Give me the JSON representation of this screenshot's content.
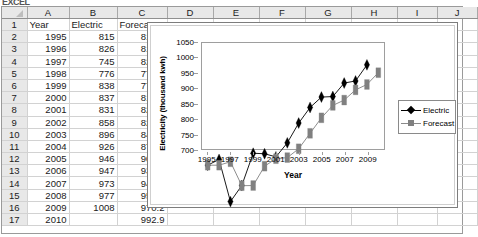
{
  "window": {
    "clipped_title": "EXCEL"
  },
  "sheet": {
    "column_headers": [
      "A",
      "B",
      "C",
      "D",
      "E",
      "F",
      "G",
      "H",
      "I",
      "J"
    ],
    "row_headers": [
      "1",
      "2",
      "3",
      "4",
      "5",
      "6",
      "7",
      "8",
      "9",
      "10",
      "11",
      "12",
      "13",
      "14",
      "15",
      "16",
      "17"
    ],
    "header_row": {
      "a": "Year",
      "b": "Electric",
      "c": "Forecast"
    },
    "rows": [
      {
        "row": "2",
        "year": "1995",
        "electric": "815",
        "forecast": "815.0"
      },
      {
        "row": "3",
        "year": "1996",
        "electric": "826",
        "forecast": "815.0"
      },
      {
        "row": "4",
        "year": "1997",
        "electric": "745",
        "forecast": "821.6"
      },
      {
        "row": "5",
        "year": "1998",
        "electric": "776",
        "forecast": "775.6"
      },
      {
        "row": "6",
        "year": "1999",
        "electric": "838",
        "forecast": "775.9"
      },
      {
        "row": "7",
        "year": "2000",
        "electric": "837",
        "forecast": "813.1"
      },
      {
        "row": "8",
        "year": "2001",
        "electric": "831",
        "forecast": "827.5"
      },
      {
        "row": "9",
        "year": "2002",
        "electric": "858",
        "forecast": "829.6"
      },
      {
        "row": "10",
        "year": "2003",
        "electric": "896",
        "forecast": "846.6"
      },
      {
        "row": "11",
        "year": "2004",
        "electric": "926",
        "forecast": "876.3"
      },
      {
        "row": "12",
        "year": "2005",
        "electric": "946",
        "forecast": "906.1"
      },
      {
        "row": "13",
        "year": "2006",
        "electric": "947",
        "forecast": "930.0"
      },
      {
        "row": "14",
        "year": "2007",
        "electric": "973",
        "forecast": "940.2"
      },
      {
        "row": "15",
        "year": "2008",
        "electric": "977",
        "forecast": "959.9"
      },
      {
        "row": "16",
        "year": "2009",
        "electric": "1008",
        "forecast": "970.2"
      },
      {
        "row": "17",
        "year": "2010",
        "electric": "",
        "forecast": "992.9"
      }
    ]
  },
  "chart_data": {
    "type": "line",
    "title": "",
    "xlabel": "Year",
    "ylabel": "Electricity (thousand kwh)",
    "x": [
      1995,
      1996,
      1997,
      1998,
      1999,
      2000,
      2001,
      2002,
      2003,
      2004,
      2005,
      2006,
      2007,
      2008,
      2009,
      2010
    ],
    "xticks": [
      "1995",
      "1997",
      "1999",
      "2001",
      "2003",
      "2005",
      "2007",
      "2009"
    ],
    "xlim": [
      1994.5,
      2010.5
    ],
    "yticks": [
      "700",
      "750",
      "800",
      "850",
      "900",
      "950",
      "1000",
      "1050"
    ],
    "ylim": [
      700,
      1050
    ],
    "grid": false,
    "legend_position": "right",
    "series": [
      {
        "name": "Electric",
        "color": "#000000",
        "marker": "diamond",
        "values": [
          815,
          826,
          745,
          776,
          838,
          837,
          831,
          858,
          896,
          926,
          946,
          947,
          973,
          977,
          1008,
          null
        ]
      },
      {
        "name": "Forecast",
        "color": "#808080",
        "marker": "square",
        "values": [
          815.0,
          815.0,
          821.6,
          775.6,
          775.9,
          813.1,
          827.5,
          829.6,
          846.6,
          876.3,
          906.1,
          930.0,
          940.2,
          959.9,
          970.2,
          992.9
        ]
      }
    ]
  }
}
